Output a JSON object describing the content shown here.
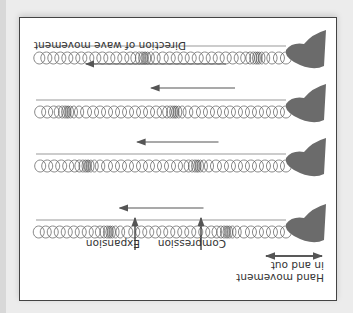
{
  "diagram": {
    "orientation": "rotated 180 degrees",
    "labels": {
      "hand": "Hand movement",
      "hand2": "in and out",
      "compression": "Compression",
      "expansion": "Expansion",
      "direction": "Direction of wave movement"
    },
    "rows": [
      {
        "index": 1,
        "compressions": [
          0.23,
          0.7
        ],
        "arrow_start": 0.55,
        "arrow_end": 0.95
      },
      {
        "index": 2,
        "compressions": [
          0.35,
          0.79
        ],
        "arrow_start": 0.45,
        "arrow_end": 0.85
      },
      {
        "index": 3,
        "compressions": [
          0.44,
          0.87
        ],
        "arrow_start": 0.34,
        "arrow_end": 0.77
      },
      {
        "index": 4,
        "compressions": [
          0.11,
          0.56
        ],
        "arrow_start": 0.15,
        "arrow_end": 0.62
      }
    ],
    "colors": {
      "background": "#ececec",
      "frame_border": "#444444",
      "spring": "#555555",
      "arrow": "#555555",
      "hand": "#6b6b6b"
    }
  }
}
